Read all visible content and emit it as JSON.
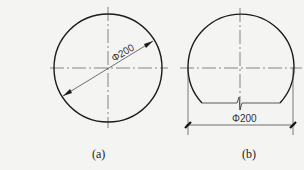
{
  "figure_a": {
    "caption": "(a)",
    "dimension_label": "Φ200",
    "shape": "full circle with diameter dimension"
  },
  "figure_b": {
    "caption": "(b)",
    "dimension_label": "Φ200",
    "shape": "truncated circle with flat break-line base"
  },
  "colors": {
    "background": "#f4f4f3",
    "outline": "#1a1a1a",
    "centerline": "#555555"
  }
}
